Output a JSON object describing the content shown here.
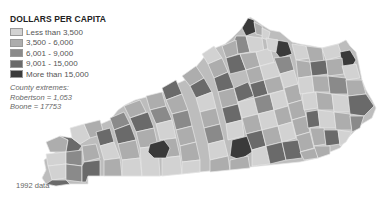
{
  "legend": {
    "title": "DOLLARS PER CAPITA",
    "items": [
      {
        "label": "Less than 3,500",
        "color": "#d2d2d2"
      },
      {
        "label": "3,500 - 6,000",
        "color": "#adadad"
      },
      {
        "label": "6,001 - 9,000",
        "color": "#8a8a8a"
      },
      {
        "label": "9,001 - 15,000",
        "color": "#6a6a6a"
      },
      {
        "label": "More than 15,000",
        "color": "#3a3a3a"
      }
    ]
  },
  "extremes": {
    "heading": "County extremes:",
    "min": "Robertson = 1,053",
    "max": "Boone = 17753"
  },
  "footnote": "1992 data",
  "map": {
    "region": "Kentucky counties",
    "outline_color": "#e8e8e8"
  }
}
